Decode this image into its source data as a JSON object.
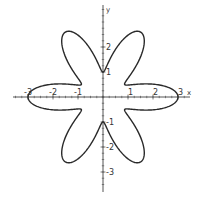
{
  "chart_data": {
    "type": "line",
    "subtype": "polar-rose",
    "title": "",
    "equation": "r = 2 + cos(6θ)",
    "params": {
      "a": 2,
      "b": 1,
      "k": 6
    },
    "xlabel": "x",
    "ylabel": "y",
    "xlim": [
      -3.6,
      3.5
    ],
    "ylim": [
      -3.8,
      3.7
    ],
    "x_ticks": [
      -3,
      -2,
      -1,
      1,
      2,
      3
    ],
    "y_ticks": [
      -3,
      -2,
      -1,
      1,
      2
    ],
    "x_tick_labels": [
      "-3",
      "-2",
      "-1",
      "1",
      "2",
      "3"
    ],
    "y_tick_labels": [
      "-3",
      "-2",
      "-1",
      "1",
      "2"
    ],
    "minor_ticks_per_unit": 4,
    "grid": false,
    "legend": null,
    "key_points": [
      {
        "x": 3,
        "y": 0
      },
      {
        "x": -3,
        "y": 0
      },
      {
        "x": 0,
        "y": 1
      },
      {
        "x": 0,
        "y": -1
      },
      {
        "x": 1.5,
        "y": 2.6
      },
      {
        "x": -1.5,
        "y": 2.6
      },
      {
        "x": 1.5,
        "y": -2.6
      },
      {
        "x": -1.5,
        "y": -2.6
      }
    ],
    "stroke_color": "#2a2a2a",
    "axis_color": "#555555"
  },
  "layout": {
    "origin_px": [
      103,
      97
    ],
    "unit_px": 25,
    "x_axis_px": [
      13,
      190
    ],
    "y_axis_px": [
      5,
      192
    ]
  }
}
